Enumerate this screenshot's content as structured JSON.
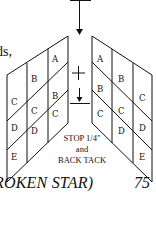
{
  "text_fragment": "ds,",
  "diagram": {
    "left_panel_labels": [
      {
        "label": "A",
        "x": 55,
        "y": 62
      },
      {
        "label": "B",
        "x": 33,
        "y": 80
      },
      {
        "label": "B",
        "x": 55,
        "y": 99
      },
      {
        "label": "C",
        "x": 13,
        "y": 102
      },
      {
        "label": "C",
        "x": 35,
        "y": 112
      },
      {
        "label": "C",
        "x": 55,
        "y": 113
      },
      {
        "label": "D",
        "x": 13,
        "y": 127
      },
      {
        "label": "D",
        "x": 35,
        "y": 132
      },
      {
        "label": "E",
        "x": 13,
        "y": 157
      }
    ],
    "right_panel_labels": [
      {
        "label": "A",
        "x": 100,
        "y": 62
      },
      {
        "label": "B",
        "x": 122,
        "y": 80
      },
      {
        "label": "B",
        "x": 100,
        "y": 92
      },
      {
        "label": "C",
        "x": 142,
        "y": 100
      },
      {
        "label": "C",
        "x": 120,
        "y": 110
      },
      {
        "label": "C",
        "x": 100,
        "y": 113
      },
      {
        "label": "D",
        "x": 142,
        "y": 127
      },
      {
        "label": "D",
        "x": 122,
        "y": 132
      },
      {
        "label": "E",
        "x": 142,
        "y": 157
      }
    ],
    "plus_symbol": "+",
    "instruction_lines": [
      "STOP 1/4\"",
      "and",
      "BACK TACK"
    ]
  },
  "caption": "ROKEN STAR)",
  "page_number": "75"
}
